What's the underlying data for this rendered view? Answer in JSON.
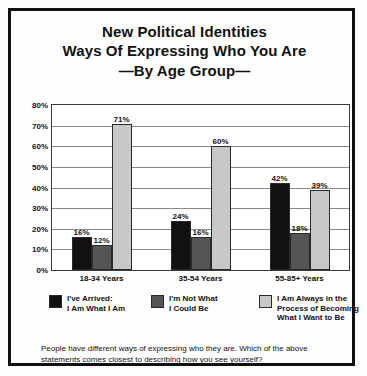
{
  "title": {
    "line1": "New Political Identities",
    "line2": "Ways Of Expressing Who You Are",
    "line3": "—By Age Group—"
  },
  "footnote": {
    "text": "People have different ways of expressing who they are. Which of the above statements comes closest to describing how you see yourself?"
  },
  "colors": {
    "series1": "#111111",
    "series2": "#555555",
    "series3": "#c8c8c8",
    "frame": "#111111",
    "gridline": "#8a8a8a",
    "background": "#fefefe",
    "text": "#111111"
  },
  "legend": {
    "items": [
      {
        "label_line1": "I've Arrived:",
        "label_line2": "I Am What I Am",
        "label_line3": "",
        "color": "#111111"
      },
      {
        "label_line1": "I'm Not What",
        "label_line2": "I Could Be",
        "label_line3": "",
        "color": "#555555"
      },
      {
        "label_line1": "I Am Always in the",
        "label_line2": "Process of Becoming",
        "label_line3": "What I Want to Be",
        "color": "#c8c8c8"
      }
    ]
  },
  "chart_data": {
    "type": "bar",
    "title": "New Political Identities Ways Of Expressing Who You Are —By Age Group—",
    "xlabel": "",
    "ylabel": "",
    "ylim": [
      0,
      80
    ],
    "ytick_labels": [
      "0%",
      "10%",
      "20%",
      "30%",
      "40%",
      "50%",
      "60%",
      "70%",
      "80%"
    ],
    "ytick_values": [
      0,
      10,
      20,
      30,
      40,
      50,
      60,
      70,
      80
    ],
    "grid": true,
    "legend_position": "bottom",
    "categories": [
      "18-34 Years",
      "35-54 Years",
      "55-85+ Years"
    ],
    "series": [
      {
        "name": "I've Arrived: I Am What I Am",
        "color": "#111111",
        "values": [
          16,
          24,
          42
        ],
        "labels": [
          "16%",
          "24%",
          "42%"
        ]
      },
      {
        "name": "I'm Not What I Could Be",
        "color": "#555555",
        "values": [
          12,
          16,
          18
        ],
        "labels": [
          "12%",
          "16%",
          "18%"
        ]
      },
      {
        "name": "I Am Always in the Process of Becoming What I Want to Be",
        "color": "#c8c8c8",
        "values": [
          71,
          60,
          39
        ],
        "labels": [
          "71%",
          "60%",
          "39%"
        ]
      }
    ]
  }
}
